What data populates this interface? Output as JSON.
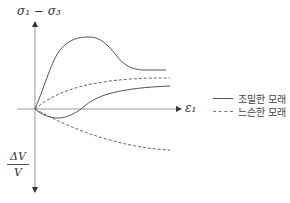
{
  "diagram": {
    "y_axis_label_top": "σ₁ − σ₃",
    "x_axis_label": "ε₁",
    "y_axis_label_bottom": {
      "numerator": "ΔV",
      "denominator": "V"
    },
    "legend": [
      {
        "label": "조밀한 모래",
        "style": "solid"
      },
      {
        "label": "느슨한 모래",
        "style": "dashed"
      }
    ],
    "colors": {
      "axis": "#999999",
      "curve": "#555555",
      "text": "#333333"
    }
  }
}
